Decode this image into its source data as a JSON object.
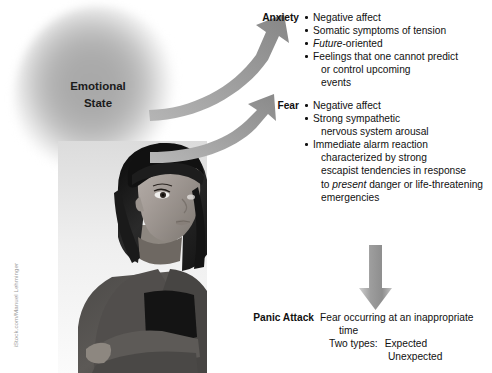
{
  "credit": "iStock.com/Manuel Lehminger",
  "source_node": {
    "line1": "Emotional",
    "line2": "State"
  },
  "anxiety": {
    "label": "Anxiety",
    "bullets": [
      {
        "text": "Negative affect"
      },
      {
        "text": "Somatic symptoms of tension"
      },
      {
        "italic_lead": "Future",
        "text": "-oriented"
      },
      {
        "text": "Feelings that one cannot predict",
        "cont": [
          "or control upcoming",
          "events"
        ]
      }
    ]
  },
  "fear": {
    "label": "Fear",
    "bullets": [
      {
        "text": "Negative affect"
      },
      {
        "text": "Strong sympathetic",
        "cont": [
          "nervous system arousal"
        ]
      },
      {
        "text": "Immediate alarm reaction",
        "cont_a": "characterized by strong",
        "cont_b": "escapist tendencies in response",
        "cont_c_pre": "to ",
        "cont_c_italic": "present",
        "cont_c_post": " danger or life-threatening",
        "cont_d": "emergencies"
      }
    ]
  },
  "panic": {
    "label": "Panic Attack",
    "line1": "Fear occurring at an inappropriate",
    "line2": "time",
    "types_label": "Two types:",
    "type1": "Expected",
    "type2": "Unexpected"
  },
  "icons": {
    "arrow_up_anxiety": "curved-arrow-up-icon",
    "arrow_up_fear": "curved-arrow-up-icon",
    "arrow_down_panic": "arrow-down-icon"
  },
  "colors": {
    "arrow_gray": "#9a9a9a",
    "arrow_gray_dark": "#7d7d7d",
    "text": "#111111",
    "blob_core": "#a8a8a8",
    "credit_gray": "#9b9b9b"
  }
}
